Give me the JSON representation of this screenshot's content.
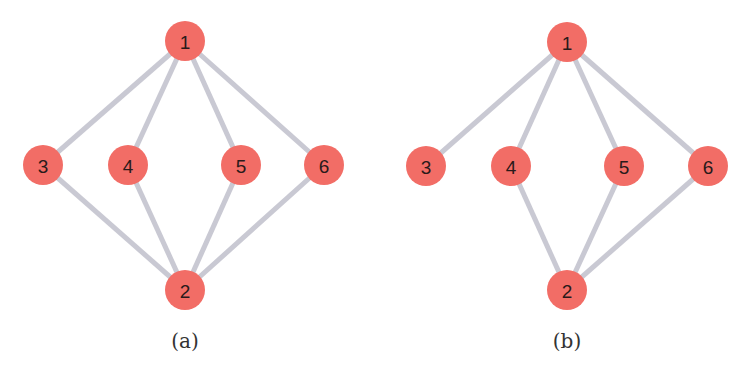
{
  "colors": {
    "node_fill": "#f26d66",
    "edge_stroke": "#c9c9d3",
    "label_text": "#2a1a1a",
    "background": "#ffffff"
  },
  "graphs": [
    {
      "caption": "(a)",
      "caption_pos": [
        185,
        341
      ],
      "node_radius": 20,
      "nodes": [
        {
          "id": "1",
          "label": "1",
          "x": 185,
          "y": 41
        },
        {
          "id": "2",
          "label": "2",
          "x": 185,
          "y": 290
        },
        {
          "id": "3",
          "label": "3",
          "x": 43,
          "y": 165
        },
        {
          "id": "4",
          "label": "4",
          "x": 128,
          "y": 165
        },
        {
          "id": "5",
          "label": "5",
          "x": 241,
          "y": 165
        },
        {
          "id": "6",
          "label": "6",
          "x": 324,
          "y": 165
        }
      ],
      "edges": [
        [
          "1",
          "3"
        ],
        [
          "1",
          "4"
        ],
        [
          "1",
          "5"
        ],
        [
          "1",
          "6"
        ],
        [
          "2",
          "3"
        ],
        [
          "2",
          "4"
        ],
        [
          "2",
          "5"
        ],
        [
          "2",
          "6"
        ]
      ]
    },
    {
      "caption": "(b)",
      "caption_pos": [
        567,
        341
      ],
      "node_radius": 20,
      "nodes": [
        {
          "id": "1",
          "label": "1",
          "x": 567,
          "y": 42
        },
        {
          "id": "2",
          "label": "2",
          "x": 567,
          "y": 290
        },
        {
          "id": "3",
          "label": "3",
          "x": 426,
          "y": 166
        },
        {
          "id": "4",
          "label": "4",
          "x": 511,
          "y": 166
        },
        {
          "id": "5",
          "label": "5",
          "x": 624,
          "y": 166
        },
        {
          "id": "6",
          "label": "6",
          "x": 708,
          "y": 166
        }
      ],
      "edges": [
        [
          "1",
          "3"
        ],
        [
          "1",
          "4"
        ],
        [
          "1",
          "5"
        ],
        [
          "1",
          "6"
        ],
        [
          "2",
          "4"
        ],
        [
          "2",
          "5"
        ],
        [
          "2",
          "6"
        ]
      ]
    }
  ]
}
